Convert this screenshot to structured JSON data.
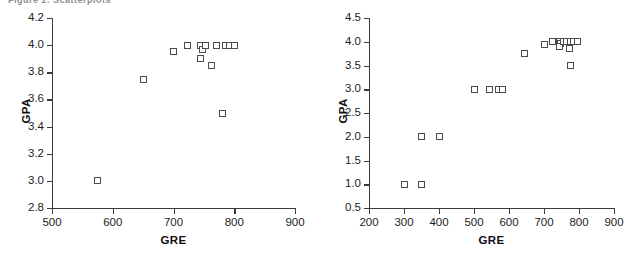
{
  "figure": {
    "clipped_caption": "Figure 2.  Scatterplots",
    "background": "#ffffff",
    "marker_edge_color": "#4a4a4f",
    "axis_color": "#3b3b3b"
  },
  "chart_data": [
    {
      "id": "left",
      "type": "scatter",
      "title": "",
      "xlabel": "GRE",
      "ylabel": "GPA",
      "xlim": [
        500,
        900
      ],
      "ylim": [
        2.8,
        4.2
      ],
      "xticks": [
        500,
        600,
        700,
        800,
        900
      ],
      "yticks": [
        2.8,
        3.0,
        3.2,
        3.4,
        3.6,
        3.8,
        4.0,
        4.2
      ],
      "xticklabels": [
        "500",
        "600",
        "700",
        "800",
        "900"
      ],
      "yticklabels": [
        "2.8",
        "3.0",
        "3.2",
        "3.4",
        "3.6",
        "3.8",
        "4.0",
        "4.2"
      ],
      "grid": false,
      "legend": null,
      "marker": "open-square",
      "points": [
        {
          "x": 575,
          "y": 3.0
        },
        {
          "x": 650,
          "y": 3.75
        },
        {
          "x": 700,
          "y": 3.95
        },
        {
          "x": 723,
          "y": 4.0
        },
        {
          "x": 745,
          "y": 4.0
        },
        {
          "x": 748,
          "y": 3.97
        },
        {
          "x": 752,
          "y": 4.0
        },
        {
          "x": 745,
          "y": 3.9
        },
        {
          "x": 763,
          "y": 3.85
        },
        {
          "x": 770,
          "y": 4.0
        },
        {
          "x": 785,
          "y": 4.0
        },
        {
          "x": 793,
          "y": 4.0
        },
        {
          "x": 800,
          "y": 4.0
        },
        {
          "x": 780,
          "y": 3.5
        }
      ]
    },
    {
      "id": "right",
      "type": "scatter",
      "title": "",
      "xlabel": "GRE",
      "ylabel": "GPA",
      "xlim": [
        200,
        900
      ],
      "ylim": [
        0.5,
        4.5
      ],
      "xticks": [
        200,
        300,
        400,
        500,
        600,
        700,
        800,
        900
      ],
      "yticks": [
        0.5,
        1.0,
        1.5,
        2.0,
        2.5,
        3.0,
        3.5,
        4.0,
        4.5
      ],
      "xticklabels": [
        "200",
        "300",
        "400",
        "500",
        "600",
        "700",
        "800",
        "900"
      ],
      "yticklabels": [
        "0.5",
        "1.0",
        "1.5",
        "2.0",
        "2.5",
        "3.0",
        "3.5",
        "4.0",
        "4.5"
      ],
      "grid": false,
      "legend": null,
      "marker": "open-square",
      "points": [
        {
          "x": 300,
          "y": 1.0
        },
        {
          "x": 350,
          "y": 1.0
        },
        {
          "x": 350,
          "y": 2.0
        },
        {
          "x": 400,
          "y": 2.0
        },
        {
          "x": 500,
          "y": 3.0
        },
        {
          "x": 545,
          "y": 3.0
        },
        {
          "x": 570,
          "y": 3.0
        },
        {
          "x": 580,
          "y": 3.0
        },
        {
          "x": 645,
          "y": 3.75
        },
        {
          "x": 700,
          "y": 3.95
        },
        {
          "x": 723,
          "y": 4.0
        },
        {
          "x": 745,
          "y": 4.0
        },
        {
          "x": 748,
          "y": 3.97
        },
        {
          "x": 745,
          "y": 3.9
        },
        {
          "x": 755,
          "y": 4.0
        },
        {
          "x": 765,
          "y": 4.0
        },
        {
          "x": 772,
          "y": 3.85
        },
        {
          "x": 775,
          "y": 4.0
        },
        {
          "x": 785,
          "y": 4.0
        },
        {
          "x": 795,
          "y": 4.0
        },
        {
          "x": 775,
          "y": 3.5
        }
      ]
    }
  ]
}
